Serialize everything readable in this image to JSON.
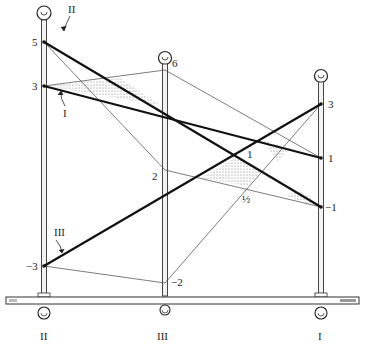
{
  "diagram": {
    "poles": [
      {
        "id": "II",
        "label": "II",
        "x": 44,
        "marks": [
          {
            "label": "5",
            "y": 42
          },
          {
            "label": "3",
            "y": 86
          },
          {
            "label": "−3",
            "y": 266
          }
        ]
      },
      {
        "id": "III",
        "label": "III",
        "x": 165,
        "marks": [
          {
            "label": "6",
            "y": 70
          },
          {
            "label": "2",
            "y": 170
          },
          {
            "label": "−2",
            "y": 283
          }
        ]
      },
      {
        "id": "I",
        "label": "I",
        "x": 321,
        "marks": [
          {
            "label": "3",
            "y": 104
          },
          {
            "label": "1",
            "y": 158
          },
          {
            "label": "−1",
            "y": 207
          }
        ]
      }
    ],
    "lines": [
      {
        "name": "II",
        "label": "II",
        "from": "II:5",
        "to": "I:−1"
      },
      {
        "name": "I",
        "label": "I",
        "from": "II:3",
        "to": "I:1"
      },
      {
        "name": "III",
        "label": "III",
        "from": "II:−3",
        "to": "I:3"
      }
    ],
    "intersections": [
      {
        "label": "1"
      },
      {
        "label": "½"
      }
    ],
    "labels": {
      "pole_II": "II",
      "pole_III": "III",
      "pole_I": "I",
      "line_II": "II",
      "line_I": "I",
      "line_III": "III",
      "m_II_5": "5",
      "m_II_3": "3",
      "m_II_n3": "−3",
      "m_III_6": "6",
      "m_III_2": "2",
      "m_III_n2": "−2",
      "m_I_3": "3",
      "m_I_1": "1",
      "m_I_n1": "−1",
      "int_1": "1",
      "int_half": "½"
    }
  }
}
